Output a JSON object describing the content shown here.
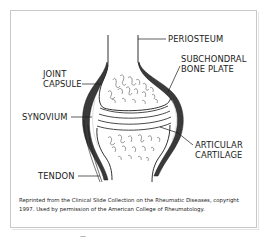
{
  "figure": {
    "type": "anatomical diagram",
    "labels": {
      "periosteum": "PERIOSTEUM",
      "subchondral_line1": "SUBCHONDRAL",
      "subchondral_line2": "BONE PLATE",
      "joint_capsule_line1": "JOINT",
      "joint_capsule_line2": "CAPSULE",
      "synovium": "SYNOVIUM",
      "articular_line1": "ARTICULAR",
      "articular_line2": "CARTILAGE",
      "tendon": "TENDON"
    },
    "caption": {
      "line1": "Reprinted from the Clinical Slide Collection on the Rheumatic Diseases, copyright",
      "line2": "1997. Used by permission of the American College of Rheumatology."
    },
    "footer_mark": "—"
  },
  "colors": {
    "ink": "#1a1a1a",
    "frame": "#c8c8c8",
    "capsule_fill": "#3a3a3a",
    "cartilage_fill": "#f4f4f4",
    "background": "#ffffff"
  }
}
